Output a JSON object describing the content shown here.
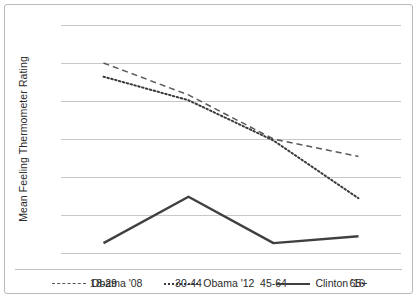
{
  "chart_data": {
    "type": "line",
    "title": "",
    "xlabel": "",
    "ylabel": "Mean Feeling Thermometer Rating",
    "categories": [
      "18-29",
      "30-44",
      "45-64",
      "65+"
    ],
    "ylim": [
      40,
      70
    ],
    "yticks": [
      40,
      45,
      50,
      55,
      60,
      65,
      70
    ],
    "grid": "horizontal",
    "legend_position": "bottom",
    "series": [
      {
        "name": "Obama '08",
        "style": "dashed",
        "color": "#595959",
        "values": [
          65.0,
          60.8,
          55.0,
          52.7
        ]
      },
      {
        "name": "Obama '12",
        "style": "dotted",
        "color": "#3a3a3a",
        "values": [
          63.2,
          60.1,
          54.8,
          47.2
        ]
      },
      {
        "name": "Clinton '16",
        "style": "solid",
        "color": "#404040",
        "values": [
          41.3,
          47.4,
          41.3,
          42.2
        ]
      }
    ]
  }
}
